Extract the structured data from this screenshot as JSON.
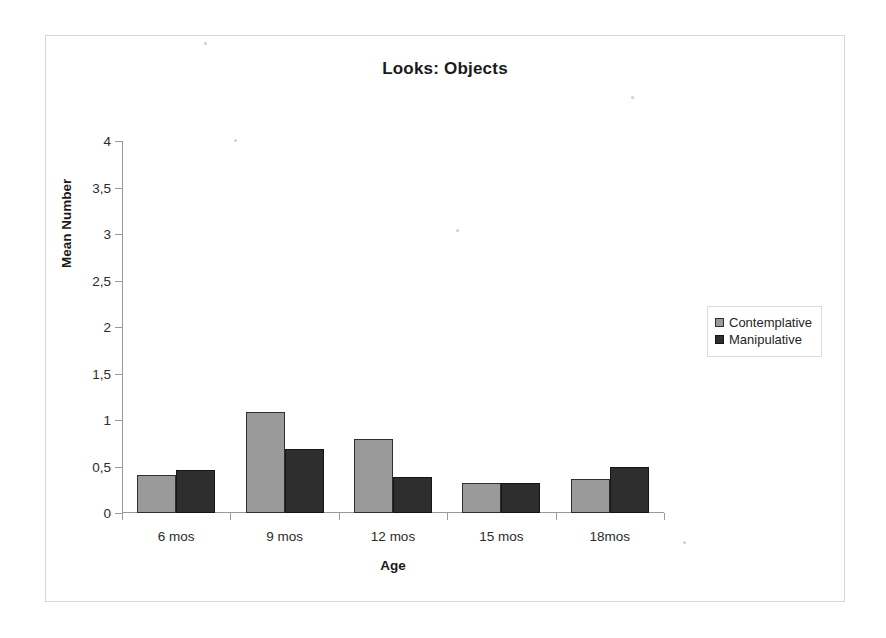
{
  "chart_data": {
    "type": "bar",
    "title": "Looks: Objects",
    "xlabel": "Age",
    "ylabel": "Mean Number",
    "categories": [
      "6 mos",
      "9 mos",
      "12 mos",
      "15 mos",
      "18mos"
    ],
    "series": [
      {
        "name": "Contemplative",
        "color": "#9a9a9a",
        "values": [
          0.41,
          1.09,
          0.8,
          0.32,
          0.37
        ]
      },
      {
        "name": "Manipulative",
        "color": "#2e2e2e",
        "values": [
          0.46,
          0.69,
          0.39,
          0.32,
          0.49
        ]
      }
    ],
    "ylim": [
      0,
      4
    ],
    "ytick_labels": [
      "0",
      "0,5",
      "1",
      "1,5",
      "2",
      "2,5",
      "3",
      "3,5",
      "4"
    ],
    "ytick_values": [
      0,
      0.5,
      1,
      1.5,
      2,
      2.5,
      3,
      3.5,
      4
    ],
    "grid": false,
    "legend_position": "right"
  }
}
